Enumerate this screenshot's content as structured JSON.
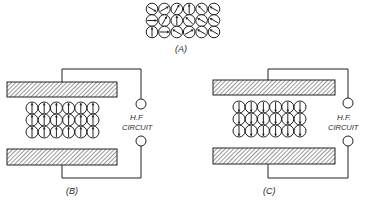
{
  "panels": {
    "a": {
      "label": "(A)"
    },
    "b": {
      "label": "(B)",
      "circuit_line1": "H.F",
      "circuit_line2": "CIRCUIT"
    },
    "c": {
      "label": "(C)",
      "circuit_line1": "H.F.",
      "circuit_line2": "CIRCUIT"
    }
  },
  "dipoles_a": [
    [
      -30,
      30,
      60,
      90,
      135,
      150
    ],
    [
      0,
      60,
      90,
      135,
      150,
      150
    ],
    [
      90,
      0,
      150,
      30,
      150,
      150
    ]
  ],
  "dipoles_b_angle": 90,
  "dipoles_c_angle": -90,
  "colors": {
    "ink": "#222222",
    "background": "#ffffff"
  }
}
